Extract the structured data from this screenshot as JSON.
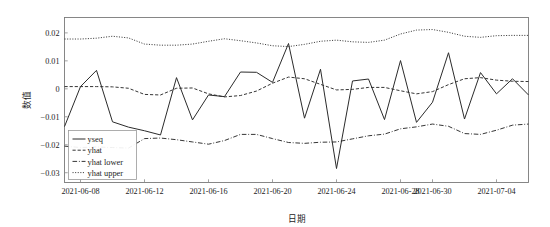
{
  "chart_data": {
    "type": "line",
    "title": "",
    "xlabel": "日期",
    "ylabel": "数值",
    "grid": false,
    "legend_position": "lower-left-inside",
    "ylim": [
      -0.0335,
      0.0255
    ],
    "yticks": [
      0.02,
      0.01,
      0,
      -0.01,
      -0.02,
      -0.03
    ],
    "ytick_labels": [
      "0.02",
      "0.01",
      "0",
      "−0.01",
      "−0.02",
      "−0.03"
    ],
    "xtick_labels": [
      "2021-06-08",
      "2021-06-12",
      "2021-06-16",
      "2021-06-20",
      "2021-06-24",
      "2021-06-28",
      "2021-06-30",
      "2021-07-04"
    ],
    "xtick_index": [
      1,
      5,
      9,
      13,
      17,
      21,
      23,
      27
    ],
    "x_index_range": [
      0,
      29
    ],
    "legend": [
      {
        "label": "yseq",
        "style": "solid"
      },
      {
        "label": "yhat",
        "style": "dashed"
      },
      {
        "label": "yhat lower",
        "style": "dashdot"
      },
      {
        "label": "yhat upper",
        "style": "dotted"
      }
    ],
    "series": [
      {
        "name": "yseq",
        "style": "solid",
        "values": [
          -0.0135,
          0.0008,
          0.0066,
          -0.0118,
          -0.0137,
          -0.015,
          -0.0165,
          0.004,
          -0.0111,
          -0.0022,
          -0.0028,
          0.006,
          0.0059,
          0.0023,
          0.0162,
          -0.0105,
          0.007,
          -0.0285,
          0.0028,
          0.0035,
          -0.011,
          0.0101,
          -0.012,
          -0.0048,
          0.0129,
          -0.0108,
          0.0058,
          -0.0018,
          0.0036,
          -0.0022
        ]
      },
      {
        "name": "yhat",
        "style": "dashed",
        "values": [
          0.0008,
          0.0008,
          0.0008,
          0.0007,
          0.0002,
          -0.002,
          -0.0022,
          0.0002,
          0.0003,
          -0.0018,
          -0.0029,
          -0.0024,
          -0.0008,
          0.002,
          0.0042,
          0.0036,
          0.0016,
          -0.0004,
          -0.0002,
          0.0005,
          0.0005,
          -0.0007,
          -0.0018,
          -0.001,
          0.0015,
          0.0036,
          0.004,
          0.0031,
          0.0027,
          0.0026
        ]
      },
      {
        "name": "yhat lower",
        "style": "dashdot",
        "values": [
          -0.0205,
          -0.021,
          -0.0208,
          -0.021,
          -0.0212,
          -0.0178,
          -0.0176,
          -0.0182,
          -0.019,
          -0.0198,
          -0.0185,
          -0.0163,
          -0.0163,
          -0.0178,
          -0.0192,
          -0.0195,
          -0.0191,
          -0.019,
          -0.0179,
          -0.0168,
          -0.0162,
          -0.0143,
          -0.0136,
          -0.0126,
          -0.0134,
          -0.016,
          -0.0163,
          -0.0148,
          -0.013,
          -0.0126
        ]
      },
      {
        "name": "yhat upper",
        "style": "dotted",
        "values": [
          0.0178,
          0.0178,
          0.0181,
          0.0188,
          0.0182,
          0.016,
          0.0156,
          0.0156,
          0.016,
          0.017,
          0.0179,
          0.0172,
          0.0164,
          0.0154,
          0.0151,
          0.0159,
          0.017,
          0.0174,
          0.0168,
          0.0166,
          0.0174,
          0.0196,
          0.021,
          0.0212,
          0.0202,
          0.0188,
          0.0184,
          0.019,
          0.0191,
          0.0191
        ]
      }
    ]
  }
}
